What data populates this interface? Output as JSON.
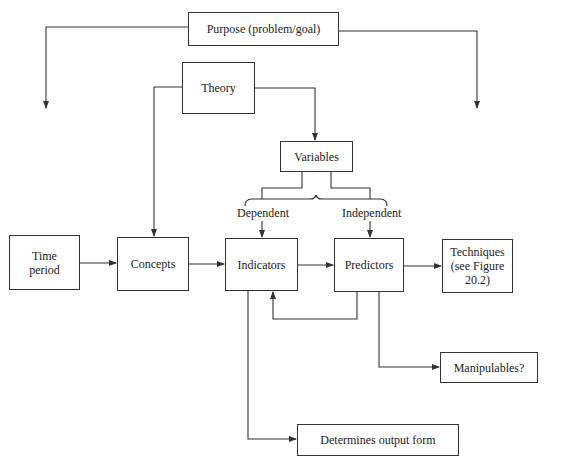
{
  "diagram": {
    "nodes": {
      "purpose": "Purpose (problem/goal)",
      "theory": "Theory",
      "variables": "Variables",
      "time_period": "Time\nperiod",
      "concepts": "Concepts",
      "indicators": "Indicators",
      "predictors": "Predictors",
      "techniques": "Techniques\n(see Figure\n20.2)",
      "manipulables": "Manipulables?",
      "output_form": "Determines output form"
    },
    "labels": {
      "dependent": "Dependent",
      "independent": "Independent"
    },
    "edges": [
      {
        "from": "purpose",
        "to": "left (off-diagram)"
      },
      {
        "from": "purpose",
        "to": "right (off-diagram)"
      },
      {
        "from": "theory",
        "to": "concepts"
      },
      {
        "from": "theory",
        "to": "variables"
      },
      {
        "from": "variables",
        "to": "indicators",
        "label": "Dependent"
      },
      {
        "from": "variables",
        "to": "predictors",
        "label": "Independent"
      },
      {
        "from": "time_period",
        "to": "concepts"
      },
      {
        "from": "concepts",
        "to": "indicators"
      },
      {
        "from": "indicators",
        "to": "predictors"
      },
      {
        "from": "predictors",
        "to": "indicators"
      },
      {
        "from": "predictors",
        "to": "techniques"
      },
      {
        "from": "predictors",
        "to": "manipulables"
      },
      {
        "from": "indicators",
        "to": "output_form"
      }
    ],
    "colors": {
      "line": "#333333",
      "background": "#ffffff"
    }
  }
}
